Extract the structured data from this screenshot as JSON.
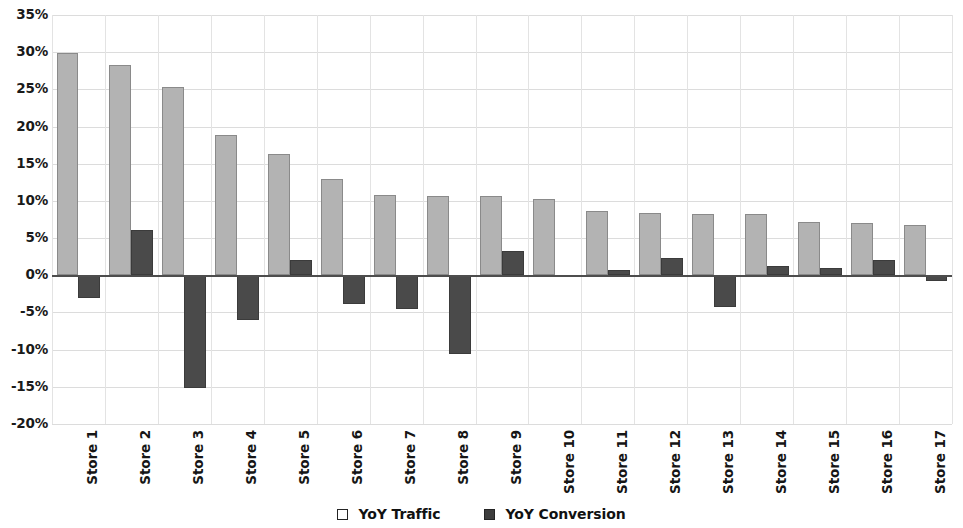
{
  "chart_data": {
    "type": "bar",
    "title": "",
    "subtitle": "",
    "xlabel": "",
    "ylabel": "",
    "ylim": [
      -20,
      35
    ],
    "ytick_step": 5,
    "ytick_labels": [
      "35%",
      "30%",
      "25%",
      "20%",
      "15%",
      "10%",
      "5%",
      "0%",
      "-5%",
      "-10%",
      "-15%",
      "-20%"
    ],
    "ytick_values": [
      35,
      30,
      25,
      20,
      15,
      10,
      5,
      0,
      -5,
      -10,
      -15,
      -20
    ],
    "grid": true,
    "legend_position": "bottom",
    "categories": [
      "Store 1",
      "Store 2",
      "Store 3",
      "Store 4",
      "Store 5",
      "Store 6",
      "Store 7",
      "Store 8",
      "Store 9",
      "Store 10",
      "Store 11",
      "Store 12",
      "Store 13",
      "Store 14",
      "Store 15",
      "Store 16",
      "Store 17"
    ],
    "series": [
      {
        "name": "YoY Traffic",
        "color": "#b3b3b3",
        "values": [
          29.9,
          28.3,
          25.3,
          18.9,
          16.3,
          13.0,
          10.8,
          10.7,
          10.6,
          10.2,
          8.6,
          8.4,
          8.3,
          8.2,
          7.2,
          7.0,
          6.7
        ]
      },
      {
        "name": "YoY Conversion",
        "color": "#4a4a4a",
        "values": [
          -3.0,
          6.1,
          -15.2,
          -6.0,
          2.1,
          -3.9,
          -4.5,
          -10.6,
          3.3,
          -0.3,
          0.7,
          2.3,
          -4.3,
          1.2,
          1.0,
          2.0,
          -0.8
        ]
      }
    ]
  },
  "legend": {
    "items": [
      {
        "label": "YoY Traffic",
        "marker": "open-square-icon"
      },
      {
        "label": "YoY Conversion",
        "marker": "filled-square-icon"
      }
    ]
  }
}
